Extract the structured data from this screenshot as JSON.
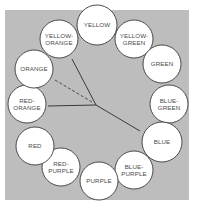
{
  "colors": {
    "background_panel": "#bdbdbd",
    "page": "#ffffff",
    "circle_fill": "#ffffff",
    "circle_stroke": "#3a3a3a",
    "label": "#4a4a4a",
    "line": "#3a3a3a"
  },
  "panel": {
    "x": 5,
    "y": 10,
    "width": 184,
    "height": 190
  },
  "hub": {
    "x": 96,
    "y": 105
  },
  "swatches": [
    {
      "id": "yellow",
      "lines": [
        "YELLOW"
      ],
      "cx": 97,
      "cy": 25,
      "r": 20
    },
    {
      "id": "yellow-green",
      "lines": [
        "YELLOW-",
        "GREEN"
      ],
      "cx": 134,
      "cy": 39,
      "r": 19
    },
    {
      "id": "green",
      "lines": [
        "GREEN"
      ],
      "cx": 162,
      "cy": 64,
      "r": 19
    },
    {
      "id": "blue-green",
      "lines": [
        "BLUE-",
        "GREEN"
      ],
      "cx": 169,
      "cy": 104,
      "r": 19
    },
    {
      "id": "blue",
      "lines": [
        "BLUE"
      ],
      "cx": 162,
      "cy": 142,
      "r": 20
    },
    {
      "id": "blue-purple",
      "lines": [
        "BLUE-",
        "PURPLE"
      ],
      "cx": 134,
      "cy": 170,
      "r": 19
    },
    {
      "id": "purple",
      "lines": [
        "PURPLE"
      ],
      "cx": 99,
      "cy": 181,
      "r": 19
    },
    {
      "id": "red-purple",
      "lines": [
        "RED-",
        "PURPLE"
      ],
      "cx": 61,
      "cy": 167,
      "r": 19
    },
    {
      "id": "red",
      "lines": [
        "RED"
      ],
      "cx": 35,
      "cy": 146,
      "r": 19
    },
    {
      "id": "red-orange",
      "lines": [
        "RED-",
        "ORANGE"
      ],
      "cx": 27,
      "cy": 104,
      "r": 19
    },
    {
      "id": "orange",
      "lines": [
        "ORANGE"
      ],
      "cx": 34,
      "cy": 69,
      "r": 19
    },
    {
      "id": "yellow-orange",
      "lines": [
        "YELLOW-",
        "ORANGE"
      ],
      "cx": 59,
      "cy": 39,
      "r": 19
    }
  ],
  "pointers": [
    {
      "id": "to-yellow-orange",
      "style": "solid",
      "x1": 96,
      "y1": 105,
      "x2": 72,
      "y2": 59
    },
    {
      "id": "to-orange",
      "style": "dashed",
      "x1": 92,
      "y1": 102,
      "x2": 55,
      "y2": 80
    },
    {
      "id": "to-red-orange",
      "style": "solid",
      "x1": 96,
      "y1": 105,
      "x2": 48,
      "y2": 106
    },
    {
      "id": "to-blue",
      "style": "solid",
      "x1": 96,
      "y1": 105,
      "x2": 140,
      "y2": 131
    }
  ]
}
